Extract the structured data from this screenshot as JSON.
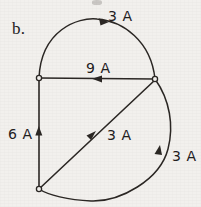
{
  "figure": {
    "part_label": "b.",
    "stroke_color": "#2b2724",
    "background_color": "#f2f0ed",
    "node_fill": "#f2f0ed",
    "nodes": [
      {
        "name": "top-left-node",
        "x": 39,
        "y": 78
      },
      {
        "name": "right-node",
        "x": 155,
        "y": 79
      },
      {
        "name": "bottom-left-node",
        "x": 39,
        "y": 189
      }
    ],
    "edges": [
      {
        "name": "top-arc",
        "label": "3 A",
        "label_x": 108,
        "label_y": 9,
        "arrow_direction": "right",
        "path": "M 39 78 C 41 30 78 17 97 19 C 123 21 151 41 155 79"
      },
      {
        "name": "horizontal-chord",
        "label": "9 A",
        "label_x": 86,
        "label_y": 61,
        "arrow_direction": "left",
        "path": "M 39 78 L 155 79"
      },
      {
        "name": "left-vertical",
        "label": "6 A",
        "label_x": 8,
        "label_y": 127,
        "arrow_direction": "up",
        "path": "M 39 79 L 39 189"
      },
      {
        "name": "diagonal",
        "label": "3 A",
        "label_x": 107,
        "label_y": 128,
        "arrow_direction": "up-right",
        "path": "M 39 189 L 155 80"
      },
      {
        "name": "right-bottom-arc",
        "label": "3 A",
        "label_x": 172,
        "label_y": 149,
        "arrow_direction": "up",
        "path": "M 155 79 C 170 100 174 126 168 149 C 160 180 120 202 91 201 C 68 200 48 195 39 189"
      }
    ]
  }
}
